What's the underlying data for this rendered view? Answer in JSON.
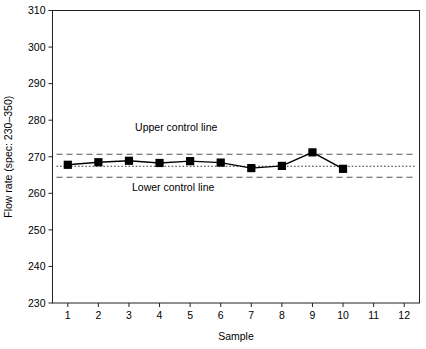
{
  "chart_data": {
    "type": "line",
    "title": "",
    "subtitle": "",
    "xlabel": "Sample",
    "ylabel": "Flow rate (spec: 230–350)",
    "x": [
      1,
      2,
      3,
      4,
      5,
      6,
      7,
      8,
      9,
      10
    ],
    "values": [
      267.8,
      268.5,
      268.9,
      268.3,
      268.8,
      268.4,
      266.9,
      267.5,
      271.2,
      266.7
    ],
    "series": [
      {
        "name": "Flow rate",
        "values": [
          267.8,
          268.5,
          268.9,
          268.3,
          268.8,
          268.4,
          266.9,
          267.5,
          271.2,
          266.7
        ],
        "marker": "square",
        "color": "#000000"
      }
    ],
    "xlim": [
      0.5,
      12.5
    ],
    "ylim": [
      230,
      310
    ],
    "xticks": [
      1,
      2,
      3,
      4,
      5,
      6,
      7,
      8,
      9,
      10,
      11,
      12
    ],
    "xticklabels": [
      "1",
      "2",
      "3",
      "4",
      "5",
      "6",
      "7",
      "8",
      "9",
      "10",
      "11",
      "12"
    ],
    "yticks": [
      230,
      240,
      250,
      260,
      270,
      280,
      290,
      300,
      310
    ],
    "yticklabels": [
      "230",
      "240",
      "250",
      "260",
      "270",
      "280",
      "290",
      "300",
      "310"
    ],
    "grid": false,
    "legend": "none",
    "reference_lines": [
      {
        "name": "upper-control-line",
        "label": "Upper control line",
        "value": 270.7,
        "style": "dashed",
        "color": "#555555"
      },
      {
        "name": "center-line",
        "label": "",
        "value": 267.4,
        "style": "dotted",
        "color": "#333333"
      },
      {
        "name": "lower-control-line",
        "label": "Lower control line",
        "value": 264.4,
        "style": "dashed",
        "color": "#555555"
      }
    ],
    "annotations": [
      {
        "name": "upper-control-line-label",
        "text": "Upper control line",
        "x": 3.2,
        "y": 277.0
      },
      {
        "name": "lower-control-line-label",
        "text": "Lower control line",
        "x": 3.1,
        "y": 260.5
      }
    ]
  }
}
